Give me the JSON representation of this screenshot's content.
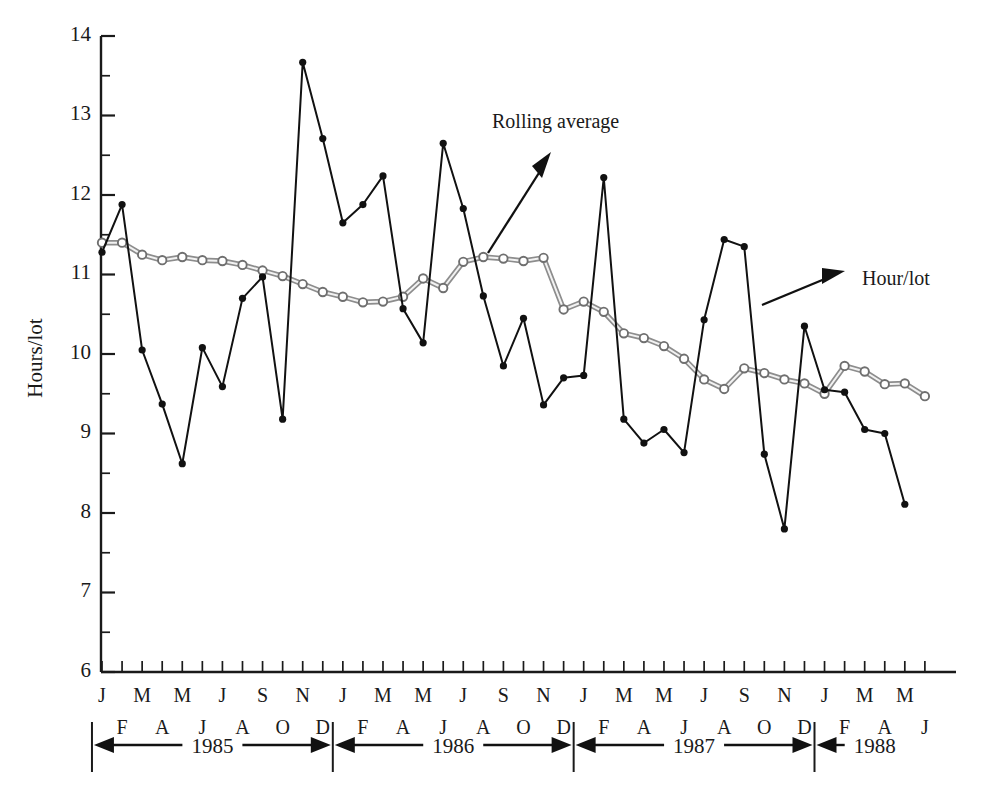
{
  "chart_data": {
    "type": "line",
    "title": "",
    "xlabel": "",
    "ylabel": "Hours/lot",
    "ylim": [
      6,
      14
    ],
    "ytick_labels": [
      "14",
      "13",
      "12",
      "11",
      "10",
      "9",
      "8",
      "7",
      "6"
    ],
    "ytick_values": [
      14,
      13,
      12,
      11,
      10,
      9,
      8,
      7,
      6
    ],
    "yminor_values": [
      13.5,
      12.5,
      11.5,
      10.5,
      9.5,
      8.5,
      7.5,
      6.5
    ],
    "grid": false,
    "legend_position": "inline-annotations",
    "annotations": [
      {
        "text": "Rolling average",
        "points_to": "rolling-average-series"
      },
      {
        "text": "Hour/lot",
        "points_to": "hour-lot-series"
      }
    ],
    "x_month_initials_top": [
      "J",
      "M",
      "M",
      "J",
      "S",
      "N",
      "J",
      "M",
      "M",
      "J",
      "S",
      "N",
      "J",
      "M",
      "M",
      "J",
      "S",
      "N",
      "J",
      "M",
      "M",
      "J"
    ],
    "x_month_initials_bottom": [
      "F",
      "A",
      "J",
      "A",
      "O",
      "D",
      "F",
      "A",
      "J",
      "A",
      "O",
      "D",
      "F",
      "A",
      "J",
      "A",
      "O",
      "D",
      "F",
      "A",
      "J"
    ],
    "x_categories": [
      "1985-J",
      "1985-F",
      "1985-M",
      "1985-A",
      "1985-M",
      "1985-J",
      "1985-J",
      "1985-A",
      "1985-S",
      "1985-O",
      "1985-N",
      "1985-D",
      "1986-J",
      "1986-F",
      "1986-M",
      "1986-A",
      "1986-M",
      "1986-J",
      "1986-J",
      "1986-A",
      "1986-S",
      "1986-O",
      "1986-N",
      "1986-D",
      "1987-J",
      "1987-F",
      "1987-M",
      "1987-A",
      "1987-M",
      "1987-J",
      "1987-J",
      "1987-A",
      "1987-S",
      "1987-O",
      "1987-N",
      "1987-D",
      "1988-J",
      "1988-F",
      "1988-M",
      "1988-A",
      "1988-M",
      "1988-J"
    ],
    "year_bands": [
      {
        "label": "1985",
        "start_index": 0,
        "end_index": 11
      },
      {
        "label": "1986",
        "start_index": 12,
        "end_index": 23
      },
      {
        "label": "1987",
        "start_index": 24,
        "end_index": 35
      },
      {
        "label": "1988",
        "start_index": 36,
        "end_index": 41
      }
    ],
    "series": [
      {
        "name": "Hour/lot",
        "marker": "filled-circle",
        "values": [
          11.28,
          11.88,
          10.05,
          9.37,
          8.62,
          10.08,
          9.59,
          10.7,
          10.97,
          9.18,
          13.67,
          12.71,
          11.65,
          11.88,
          12.24,
          10.57,
          10.14,
          12.65,
          11.83,
          10.73,
          9.85,
          10.45,
          9.36,
          9.7,
          9.73,
          12.22,
          9.18,
          8.88,
          9.05,
          8.76,
          10.43,
          11.44,
          11.35,
          8.74,
          7.8,
          10.35,
          9.55,
          9.52,
          9.05,
          9.0,
          8.11
        ]
      },
      {
        "name": "Rolling average",
        "marker": "open-circle",
        "values": [
          11.4,
          11.4,
          11.25,
          11.18,
          11.22,
          11.18,
          11.17,
          11.12,
          11.05,
          10.98,
          10.88,
          10.78,
          10.72,
          10.65,
          10.66,
          10.72,
          10.95,
          10.83,
          11.16,
          11.22,
          11.2,
          11.17,
          11.21,
          10.56,
          10.66,
          10.53,
          10.26,
          10.2,
          10.1,
          9.94,
          9.68,
          9.56,
          9.82,
          9.76,
          9.68,
          9.63,
          9.5,
          9.85,
          9.78,
          9.62,
          9.63,
          9.47
        ]
      }
    ]
  },
  "axes": {
    "y_label": "Hours/lot"
  }
}
